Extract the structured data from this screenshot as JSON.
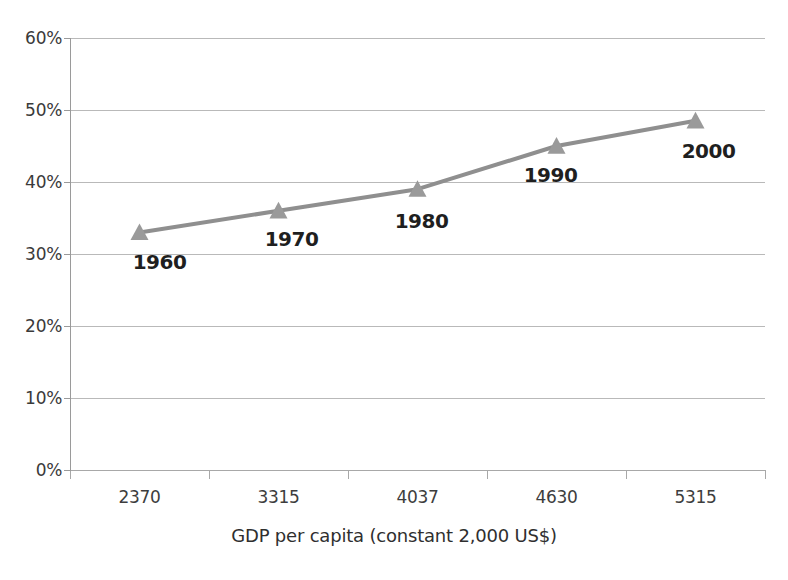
{
  "chart_data": {
    "type": "line",
    "title": "",
    "subtitle": "",
    "xlabel": "GDP per capita (constant 2,000 US$)",
    "ylabel": "",
    "categories": [
      "2370",
      "3315",
      "4037",
      "4630",
      "5315"
    ],
    "point_labels": [
      "1960",
      "1970",
      "1980",
      "1990",
      "2000"
    ],
    "values": [
      33,
      36,
      39,
      45,
      48.5
    ],
    "value_suffix": "%",
    "ylim": [
      0,
      60
    ],
    "ytick_values": [
      60,
      50,
      40,
      30,
      20,
      10,
      0
    ],
    "ytick_labels": [
      "60%",
      "50%",
      "40%",
      "30%",
      "20%",
      "10%",
      "0%"
    ],
    "grid": true,
    "grid_axis": "y",
    "legend": false,
    "legend_position": "none",
    "series": [
      {
        "name": "",
        "values": [
          33,
          36,
          39,
          45,
          48.5
        ],
        "marker": "triangle",
        "color": "#8f8f8f"
      }
    ],
    "colors": {
      "line": "#8f8f8f",
      "marker": "#9a9a9a",
      "gridline": "#b9b9b9",
      "axis": "#9a9a9a",
      "text": "#2f2f2f",
      "background": "#ffffff"
    }
  },
  "axes": {
    "y_ticks": [
      {
        "label": "60%",
        "value": 60
      },
      {
        "label": "50%",
        "value": 50
      },
      {
        "label": "40%",
        "value": 40
      },
      {
        "label": "30%",
        "value": 30
      },
      {
        "label": "20%",
        "value": 20
      },
      {
        "label": "10%",
        "value": 10
      },
      {
        "label": "0%",
        "value": 0
      }
    ],
    "x_ticks": [
      {
        "label": "2370"
      },
      {
        "label": "3315"
      },
      {
        "label": "4037"
      },
      {
        "label": "4630"
      },
      {
        "label": "5315"
      }
    ],
    "x_title": "GDP per capita (constant 2,000 US$)"
  },
  "data_labels": [
    {
      "text": "1960"
    },
    {
      "text": "1970"
    },
    {
      "text": "1980"
    },
    {
      "text": "1990"
    },
    {
      "text": "2000"
    }
  ]
}
